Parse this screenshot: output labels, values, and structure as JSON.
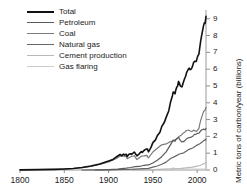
{
  "chart_data": {
    "type": "line",
    "title": "",
    "xlabel": "",
    "ylabel": "Metric tons of carbon/year (billions)",
    "xlim": [
      1800,
      2010
    ],
    "ylim": [
      0,
      9.4
    ],
    "xticks": [
      1800,
      1850,
      1900,
      1950,
      2000
    ],
    "yticks": [
      0,
      1,
      2,
      3,
      4,
      5,
      6,
      7,
      8,
      9
    ],
    "grid": false,
    "legend_position": "top-left",
    "axis_style": "bottom-and-right",
    "series": [
      {
        "name": "Total",
        "color": "#111111",
        "width": 1.6,
        "points": [
          [
            1800,
            0.01
          ],
          [
            1820,
            0.02
          ],
          [
            1840,
            0.04
          ],
          [
            1850,
            0.06
          ],
          [
            1860,
            0.09
          ],
          [
            1870,
            0.15
          ],
          [
            1880,
            0.24
          ],
          [
            1890,
            0.36
          ],
          [
            1900,
            0.53
          ],
          [
            1905,
            0.63
          ],
          [
            1910,
            0.82
          ],
          [
            1913,
            0.92
          ],
          [
            1915,
            0.85
          ],
          [
            1917,
            0.94
          ],
          [
            1918,
            0.9
          ],
          [
            1920,
            0.93
          ],
          [
            1921,
            0.8
          ],
          [
            1923,
            0.94
          ],
          [
            1925,
            0.97
          ],
          [
            1926,
            0.93
          ],
          [
            1929,
            1.07
          ],
          [
            1930,
            1.0
          ],
          [
            1932,
            0.84
          ],
          [
            1934,
            0.93
          ],
          [
            1937,
            1.1
          ],
          [
            1938,
            1.04
          ],
          [
            1940,
            1.16
          ],
          [
            1941,
            1.2
          ],
          [
            1943,
            1.25
          ],
          [
            1944,
            1.24
          ],
          [
            1945,
            1.08
          ],
          [
            1946,
            1.16
          ],
          [
            1948,
            1.36
          ],
          [
            1950,
            1.63
          ],
          [
            1953,
            1.79
          ],
          [
            1955,
            2.04
          ],
          [
            1958,
            2.25
          ],
          [
            1960,
            2.58
          ],
          [
            1963,
            2.84
          ],
          [
            1965,
            3.13
          ],
          [
            1968,
            3.53
          ],
          [
            1970,
            4.05
          ],
          [
            1972,
            4.4
          ],
          [
            1973,
            4.64
          ],
          [
            1974,
            4.62
          ],
          [
            1975,
            4.53
          ],
          [
            1976,
            4.78
          ],
          [
            1977,
            4.93
          ],
          [
            1978,
            5.0
          ],
          [
            1979,
            5.27
          ],
          [
            1980,
            5.16
          ],
          [
            1981,
            5.0
          ],
          [
            1982,
            4.96
          ],
          [
            1983,
            4.95
          ],
          [
            1984,
            5.15
          ],
          [
            1985,
            5.31
          ],
          [
            1986,
            5.46
          ],
          [
            1987,
            5.58
          ],
          [
            1988,
            5.78
          ],
          [
            1989,
            5.89
          ],
          [
            1990,
            5.99
          ],
          [
            1991,
            6.06
          ],
          [
            1992,
            5.97
          ],
          [
            1993,
            5.99
          ],
          [
            1994,
            6.07
          ],
          [
            1995,
            6.21
          ],
          [
            1996,
            6.39
          ],
          [
            1997,
            6.46
          ],
          [
            1998,
            6.46
          ],
          [
            1999,
            6.46
          ],
          [
            2000,
            6.66
          ],
          [
            2001,
            6.81
          ],
          [
            2002,
            6.9
          ],
          [
            2003,
            7.3
          ],
          [
            2004,
            7.68
          ],
          [
            2005,
            7.98
          ],
          [
            2006,
            8.25
          ],
          [
            2007,
            8.53
          ],
          [
            2008,
            8.74
          ],
          [
            2009,
            8.72
          ],
          [
            2010,
            9.14
          ]
        ]
      },
      {
        "name": "Petroleum",
        "color": "#5a5a5a",
        "width": 1.2,
        "points": [
          [
            1870,
            0.0
          ],
          [
            1890,
            0.01
          ],
          [
            1900,
            0.02
          ],
          [
            1910,
            0.05
          ],
          [
            1920,
            0.11
          ],
          [
            1925,
            0.15
          ],
          [
            1930,
            0.2
          ],
          [
            1935,
            0.21
          ],
          [
            1940,
            0.28
          ],
          [
            1945,
            0.3
          ],
          [
            1950,
            0.42
          ],
          [
            1955,
            0.58
          ],
          [
            1960,
            0.79
          ],
          [
            1965,
            1.08
          ],
          [
            1970,
            1.51
          ],
          [
            1973,
            1.78
          ],
          [
            1974,
            1.75
          ],
          [
            1975,
            1.7
          ],
          [
            1976,
            1.81
          ],
          [
            1977,
            1.87
          ],
          [
            1978,
            1.91
          ],
          [
            1979,
            1.96
          ],
          [
            1980,
            1.84
          ],
          [
            1981,
            1.76
          ],
          [
            1982,
            1.7
          ],
          [
            1983,
            1.67
          ],
          [
            1984,
            1.7
          ],
          [
            1985,
            1.69
          ],
          [
            1986,
            1.75
          ],
          [
            1987,
            1.79
          ],
          [
            1988,
            1.86
          ],
          [
            1989,
            1.89
          ],
          [
            1990,
            1.91
          ],
          [
            1991,
            1.92
          ],
          [
            1992,
            1.94
          ],
          [
            1993,
            1.94
          ],
          [
            1994,
            1.98
          ],
          [
            1995,
            2.01
          ],
          [
            1996,
            2.06
          ],
          [
            1997,
            2.12
          ],
          [
            1998,
            2.12
          ],
          [
            1999,
            2.14
          ],
          [
            2000,
            2.17
          ],
          [
            2001,
            2.18
          ],
          [
            2002,
            2.19
          ],
          [
            2003,
            2.25
          ],
          [
            2004,
            2.34
          ],
          [
            2005,
            2.38
          ],
          [
            2006,
            2.4
          ],
          [
            2007,
            2.43
          ],
          [
            2008,
            2.42
          ],
          [
            2009,
            2.39
          ],
          [
            2010,
            2.47
          ]
        ]
      },
      {
        "name": "Coal",
        "color": "#7a7a7a",
        "width": 1.2,
        "points": [
          [
            1800,
            0.01
          ],
          [
            1820,
            0.02
          ],
          [
            1840,
            0.04
          ],
          [
            1850,
            0.05
          ],
          [
            1860,
            0.09
          ],
          [
            1870,
            0.14
          ],
          [
            1880,
            0.22
          ],
          [
            1890,
            0.33
          ],
          [
            1900,
            0.48
          ],
          [
            1910,
            0.72
          ],
          [
            1913,
            0.84
          ],
          [
            1917,
            0.83
          ],
          [
            1920,
            0.8
          ],
          [
            1921,
            0.67
          ],
          [
            1925,
            0.79
          ],
          [
            1929,
            0.85
          ],
          [
            1932,
            0.62
          ],
          [
            1937,
            0.82
          ],
          [
            1940,
            0.84
          ],
          [
            1943,
            0.87
          ],
          [
            1945,
            0.72
          ],
          [
            1950,
            1.07
          ],
          [
            1955,
            1.29
          ],
          [
            1960,
            1.5
          ],
          [
            1965,
            1.55
          ],
          [
            1970,
            1.69
          ],
          [
            1973,
            1.73
          ],
          [
            1975,
            1.8
          ],
          [
            1978,
            1.88
          ],
          [
            1980,
            2.01
          ],
          [
            1982,
            2.07
          ],
          [
            1984,
            2.18
          ],
          [
            1986,
            2.25
          ],
          [
            1988,
            2.35
          ],
          [
            1990,
            2.38
          ],
          [
            1992,
            2.32
          ],
          [
            1994,
            2.29
          ],
          [
            1996,
            2.37
          ],
          [
            1998,
            2.32
          ],
          [
            1999,
            2.29
          ],
          [
            2000,
            2.34
          ],
          [
            2001,
            2.41
          ],
          [
            2002,
            2.47
          ],
          [
            2003,
            2.73
          ],
          [
            2004,
            2.95
          ],
          [
            2005,
            3.12
          ],
          [
            2006,
            3.28
          ],
          [
            2007,
            3.44
          ],
          [
            2008,
            3.53
          ],
          [
            2009,
            3.56
          ],
          [
            2010,
            3.72
          ]
        ]
      },
      {
        "name": "Natural gas",
        "color": "#666666",
        "width": 1.2,
        "points": [
          [
            1885,
            0.0
          ],
          [
            1900,
            0.01
          ],
          [
            1910,
            0.02
          ],
          [
            1920,
            0.03
          ],
          [
            1930,
            0.05
          ],
          [
            1940,
            0.08
          ],
          [
            1945,
            0.1
          ],
          [
            1950,
            0.17
          ],
          [
            1955,
            0.24
          ],
          [
            1960,
            0.34
          ],
          [
            1965,
            0.47
          ],
          [
            1970,
            0.68
          ],
          [
            1975,
            0.81
          ],
          [
            1980,
            0.95
          ],
          [
            1985,
            1.02
          ],
          [
            1990,
            1.21
          ],
          [
            1995,
            1.31
          ],
          [
            2000,
            1.48
          ],
          [
            2003,
            1.56
          ],
          [
            2005,
            1.64
          ],
          [
            2007,
            1.73
          ],
          [
            2008,
            1.78
          ],
          [
            2009,
            1.76
          ],
          [
            2010,
            1.85
          ]
        ]
      },
      {
        "name": "Cement production",
        "color": "#b8b8b8",
        "width": 1.1,
        "points": [
          [
            1928,
            0.0
          ],
          [
            1940,
            0.01
          ],
          [
            1950,
            0.02
          ],
          [
            1960,
            0.04
          ],
          [
            1970,
            0.06
          ],
          [
            1980,
            0.09
          ],
          [
            1990,
            0.14
          ],
          [
            1995,
            0.17
          ],
          [
            2000,
            0.23
          ],
          [
            2003,
            0.27
          ],
          [
            2005,
            0.31
          ],
          [
            2007,
            0.36
          ],
          [
            2009,
            0.41
          ],
          [
            2010,
            0.45
          ]
        ]
      },
      {
        "name": "Gas flaring",
        "color": "#cdcdcd",
        "width": 1.1,
        "points": [
          [
            1950,
            0.02
          ],
          [
            1960,
            0.04
          ],
          [
            1970,
            0.07
          ],
          [
            1973,
            0.11
          ],
          [
            1975,
            0.1
          ],
          [
            1980,
            0.09
          ],
          [
            1985,
            0.07
          ],
          [
            1990,
            0.06
          ],
          [
            1995,
            0.06
          ],
          [
            2000,
            0.06
          ],
          [
            2005,
            0.06
          ],
          [
            2010,
            0.06
          ]
        ]
      }
    ]
  },
  "legend": {
    "items": [
      {
        "label": "Total"
      },
      {
        "label": "Petroleum"
      },
      {
        "label": "Coal"
      },
      {
        "label": "Natural gas"
      },
      {
        "label": "Cement production"
      },
      {
        "label": "Gas flaring"
      }
    ]
  },
  "axes": {
    "y_title": "Metric tons of carbon/year (billions)",
    "y_tick_labels": [
      "9",
      "8",
      "7",
      "6",
      "5",
      "4",
      "3",
      "2",
      "1",
      "0"
    ],
    "x_tick_labels": [
      "1800",
      "1850",
      "1900",
      "1950",
      "2000"
    ]
  }
}
